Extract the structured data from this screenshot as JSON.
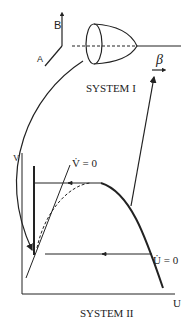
{
  "system1": {
    "title": "SYSTEM I",
    "axis_b": "B",
    "axis_a": "A",
    "beta": "β"
  },
  "system2": {
    "title": "SYSTEM II",
    "y_axis": "V",
    "x_axis": "U",
    "v_nullcline": "V̇ = 0",
    "u_nullcline": "U̇ = 0"
  },
  "colors": {
    "ink": "#222222",
    "background": "#ffffff"
  }
}
